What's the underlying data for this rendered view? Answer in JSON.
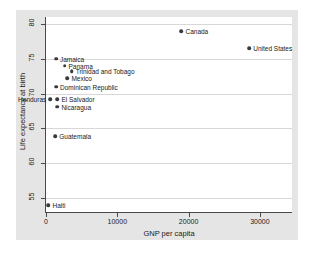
{
  "chart_data": {
    "type": "scatter",
    "title": "",
    "xlabel": "GNP per capita",
    "ylabel": "Life expectancy at birth",
    "xlim": [
      0,
      34500
    ],
    "ylim": [
      53,
      81
    ],
    "xticks": [
      0,
      10000,
      20000,
      30000
    ],
    "xtick_labels": [
      "0",
      "10000",
      "20000",
      "30000"
    ],
    "yticks": [
      55,
      60,
      65,
      70,
      75,
      80
    ],
    "ytick_labels": [
      "55",
      "60",
      "65",
      "70",
      "75",
      "80"
    ],
    "grid": "horizontal",
    "legend": "none",
    "marker": "filled-circle",
    "marker_color": "#3a3a3a",
    "points": [
      {
        "label": "Canada",
        "x": 19000,
        "y": 79.0,
        "label_pos": "right"
      },
      {
        "label": "United States",
        "x": 28500,
        "y": 76.5,
        "label_pos": "right"
      },
      {
        "label": "Jamaica",
        "x": 1400,
        "y": 75.0,
        "label_pos": "right"
      },
      {
        "label": "Panama",
        "x": 2600,
        "y": 74.0,
        "label_pos": "right"
      },
      {
        "label": "Trinidad and Tobago",
        "x": 3600,
        "y": 73.2,
        "label_pos": "right"
      },
      {
        "label": "Mexico",
        "x": 3000,
        "y": 72.2,
        "label_pos": "right"
      },
      {
        "label": "Dominican Republic",
        "x": 1400,
        "y": 71.0,
        "label_pos": "right"
      },
      {
        "label": "Honduras",
        "x": 600,
        "y": 69.2,
        "label_pos": "left"
      },
      {
        "label": "El Salvador",
        "x": 1600,
        "y": 69.2,
        "label_pos": "right"
      },
      {
        "label": "Nicaragua",
        "x": 1600,
        "y": 68.1,
        "label_pos": "right"
      },
      {
        "label": "Guatemala",
        "x": 1300,
        "y": 63.9,
        "label_pos": "right"
      },
      {
        "label": "Haiti",
        "x": 350,
        "y": 54.0,
        "label_pos": "right"
      }
    ]
  }
}
